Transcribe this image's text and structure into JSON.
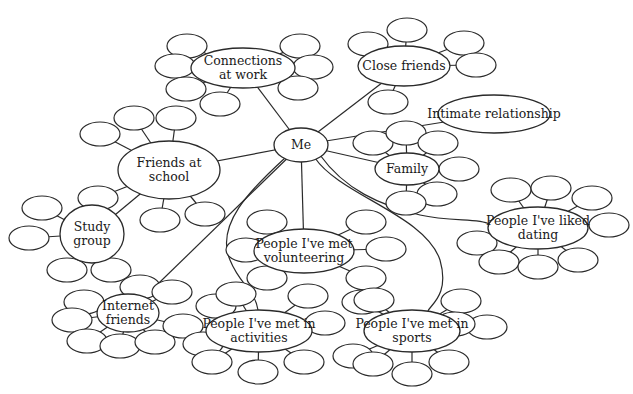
{
  "diagram": {
    "type": "social-network-mind-map",
    "center": {
      "id": "me",
      "label": [
        "Me"
      ],
      "cx": 301,
      "cy": 145,
      "rx": 27,
      "ry": 17
    },
    "nodes": [
      {
        "id": "work",
        "label": [
          "Connections",
          "at work"
        ],
        "cx": 243,
        "cy": 68,
        "rx": 52,
        "ry": 20,
        "leaves": [
          [
            187,
            46
          ],
          [
            175,
            66
          ],
          [
            186,
            89
          ],
          [
            220,
            104
          ],
          [
            300,
            46
          ],
          [
            313,
            67
          ],
          [
            298,
            88
          ]
        ]
      },
      {
        "id": "close",
        "label": [
          "Close friends"
        ],
        "cx": 404,
        "cy": 66,
        "rx": 46,
        "ry": 20,
        "leaves": [
          [
            368,
            44
          ],
          [
            407,
            30
          ],
          [
            464,
            43
          ],
          [
            476,
            65
          ],
          [
            388,
            102
          ]
        ]
      },
      {
        "id": "intimate",
        "label": [
          "Intimate relationship"
        ],
        "cx": 494,
        "cy": 114,
        "rx": 56,
        "ry": 19,
        "leaves": []
      },
      {
        "id": "family",
        "label": [
          "Family"
        ],
        "cx": 407,
        "cy": 169,
        "rx": 32,
        "ry": 16,
        "leaves": [
          [
            373,
            143
          ],
          [
            406,
            133
          ],
          [
            438,
            143
          ],
          [
            459,
            169
          ],
          [
            437,
            194
          ],
          [
            406,
            203
          ]
        ]
      },
      {
        "id": "school",
        "label": [
          "Friends at",
          "school"
        ],
        "cx": 169,
        "cy": 170,
        "rx": 51,
        "ry": 29,
        "leaves": [
          [
            100,
            134
          ],
          [
            134,
            118
          ],
          [
            176,
            118
          ],
          [
            98,
            198
          ],
          [
            160,
            220
          ],
          [
            205,
            214
          ]
        ]
      },
      {
        "id": "study",
        "label": [
          "Study",
          "group"
        ],
        "cx": 92,
        "cy": 234,
        "rx": 32,
        "ry": 29,
        "leaves": [
          [
            42,
            208
          ],
          [
            29,
            238
          ],
          [
            67,
            270
          ],
          [
            111,
            270
          ]
        ]
      },
      {
        "id": "dating",
        "label": [
          "People I've liked",
          "dating"
        ],
        "cx": 538,
        "cy": 228,
        "rx": 50,
        "ry": 21,
        "leaves": [
          [
            511,
            190
          ],
          [
            551,
            188
          ],
          [
            592,
            198
          ],
          [
            609,
            225
          ],
          [
            477,
            243
          ],
          [
            499,
            262
          ],
          [
            538,
            267
          ],
          [
            578,
            260
          ]
        ]
      },
      {
        "id": "volunteer",
        "label": [
          "People I've met",
          "volunteering"
        ],
        "cx": 304,
        "cy": 251,
        "rx": 50,
        "ry": 22,
        "leaves": [
          [
            267,
            222
          ],
          [
            246,
            250
          ],
          [
            267,
            278
          ],
          [
            366,
            222
          ],
          [
            386,
            249
          ],
          [
            366,
            278
          ]
        ]
      },
      {
        "id": "internet",
        "label": [
          "Internet",
          "friends"
        ],
        "cx": 128,
        "cy": 313,
        "rx": 31,
        "ry": 19,
        "leaves": [
          [
            84,
            302
          ],
          [
            72,
            320
          ],
          [
            87,
            341
          ],
          [
            120,
            346
          ],
          [
            155,
            342
          ],
          [
            183,
            326
          ],
          [
            140,
            287
          ],
          [
            172,
            292
          ]
        ]
      },
      {
        "id": "activities",
        "label": [
          "People I've met in",
          "activities"
        ],
        "cx": 259,
        "cy": 331,
        "rx": 53,
        "ry": 21,
        "leaves": [
          [
            216,
            306
          ],
          [
            236,
            294
          ],
          [
            203,
            344
          ],
          [
            212,
            362
          ],
          [
            258,
            372
          ],
          [
            304,
            362
          ],
          [
            308,
            296
          ],
          [
            325,
            323
          ]
        ]
      },
      {
        "id": "sports",
        "label": [
          "People I've met in",
          "sports"
        ],
        "cx": 412,
        "cy": 331,
        "rx": 48,
        "ry": 21,
        "leaves": [
          [
            362,
            302
          ],
          [
            374,
            300
          ],
          [
            353,
            356
          ],
          [
            373,
            364
          ],
          [
            412,
            374
          ],
          [
            449,
            362
          ],
          [
            461,
            301
          ],
          [
            487,
            327
          ],
          [
            455,
            324
          ]
        ]
      }
    ],
    "straight_edges": [
      [
        "me",
        "work"
      ],
      [
        "me",
        "close"
      ],
      [
        "me",
        "intimate"
      ],
      [
        "me",
        "family"
      ],
      [
        "me",
        "school"
      ],
      [
        "me",
        "volunteer"
      ],
      [
        "school",
        "study"
      ],
      [
        "me",
        "internet"
      ]
    ],
    "curved_edges": [
      {
        "from": "me",
        "to": "activities",
        "path": "M 285 158 C 250 190, 215 225, 230 260 C 240 285, 255 290, 258 310"
      },
      {
        "from": "me",
        "to": "sports",
        "path": "M 315 158 C 340 195, 425 215, 440 260 C 450 295, 430 305, 428 311"
      },
      {
        "from": "me",
        "to": "dating",
        "path": "M 320 155 C 345 190, 380 205, 420 215 C 450 222, 480 218, 489 224"
      }
    ],
    "leaf_ellipse": {
      "rx": 20,
      "ry": 12
    }
  }
}
